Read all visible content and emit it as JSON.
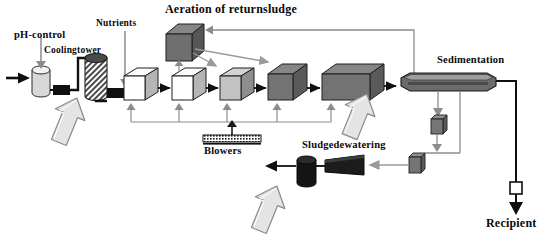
{
  "diagram": {
    "labels": {
      "ph_control": "pH-control",
      "cooling_tower": "Coolingtower",
      "nutrients": "Nutrients",
      "aeration_return_sludge": "Aeration of returnsludge",
      "sedimentation": "Sedimentation",
      "blowers": "Blowers",
      "sludge_dewatering": "Sludgedewatering",
      "recipient": "Recipient"
    },
    "nodes": [
      {
        "name": "influent-arrow",
        "shape": "arrow",
        "label": ""
      },
      {
        "name": "ph-control-vessel",
        "shape": "cylinder",
        "label": "pH-control"
      },
      {
        "name": "pump-1",
        "shape": "pump-block",
        "label": ""
      },
      {
        "name": "cooling-tower-vessel",
        "shape": "hatched-cylinder",
        "label": "Coolingtower"
      },
      {
        "name": "pump-2",
        "shape": "pump-block",
        "label": ""
      },
      {
        "name": "reactor-1",
        "shape": "cube",
        "label": "",
        "fill": "#ffffff"
      },
      {
        "name": "reactor-2",
        "shape": "cube",
        "label": "",
        "fill": "#ffffff"
      },
      {
        "name": "reactor-3",
        "shape": "cube",
        "label": "",
        "fill": "#c8c8c8"
      },
      {
        "name": "reactor-4",
        "shape": "cube",
        "label": "",
        "fill": "#757575"
      },
      {
        "name": "reactor-5",
        "shape": "box-wide",
        "label": "",
        "fill": "#6e6e6e"
      },
      {
        "name": "aeration-tank",
        "shape": "cube",
        "label": "Aeration of returnsludge",
        "fill": "#6e6e6e"
      },
      {
        "name": "sedimentation-tank",
        "shape": "lozenge",
        "label": "Sedimentation",
        "fill": "#6a6a6a"
      },
      {
        "name": "blowers-unit",
        "shape": "hatched-bar",
        "label": "Blowers"
      },
      {
        "name": "sludge-pump-upper",
        "shape": "small-cube",
        "label": "",
        "fill": "#707070"
      },
      {
        "name": "sludge-pump-lower",
        "shape": "small-cube",
        "label": "",
        "fill": "#707070"
      },
      {
        "name": "dewatering-unit",
        "shape": "wedge",
        "label": "Sludgedewatering",
        "fill": "#1c1c1c"
      },
      {
        "name": "sludge-cake-silo",
        "shape": "cylinder-dark",
        "label": "",
        "fill": "#141414"
      },
      {
        "name": "effluent-valve",
        "shape": "small-square",
        "label": "",
        "fill": "#ffffff"
      },
      {
        "name": "recipient-outlet",
        "shape": "arrow",
        "label": "Recipient"
      }
    ],
    "callout_arrows": [
      {
        "name": "callout-arrow-cooling-tower",
        "direction": "up-right"
      },
      {
        "name": "callout-arrow-reactor-bank",
        "direction": "up-right"
      },
      {
        "name": "callout-arrow-dewatering",
        "direction": "up-right"
      }
    ],
    "colors": {
      "line": "#1a1a1a",
      "gray_line": "#8c8c8c",
      "callout_fill": "#e2e2e2",
      "callout_stroke": "#8a8a8a",
      "tank_white": "#ffffff",
      "tank_light": "#c8c8c8",
      "tank_dark": "#6e6e6e",
      "dark_equipment": "#141414"
    }
  }
}
